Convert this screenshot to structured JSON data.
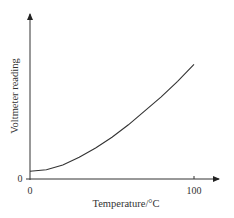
{
  "chart_data": {
    "type": "line",
    "title": "",
    "xlabel": "Temperature/°C",
    "ylabel": "Voltmeter reading",
    "x_ticks": [
      "0",
      "100"
    ],
    "y_ticks": [
      "0"
    ],
    "xlim": [
      0,
      110
    ],
    "ylim": [
      0,
      1
    ],
    "grid": false,
    "legend": null,
    "series": [
      {
        "name": "Voltmeter reading vs temperature",
        "shape": "increasing, concave up (quadratic-like), starts slightly above 0",
        "x": [
          0,
          10,
          20,
          30,
          40,
          50,
          60,
          70,
          80,
          90,
          100
        ],
        "values": [
          0.05,
          0.06,
          0.09,
          0.14,
          0.2,
          0.27,
          0.35,
          0.44,
          0.53,
          0.63,
          0.74
        ]
      }
    ]
  }
}
